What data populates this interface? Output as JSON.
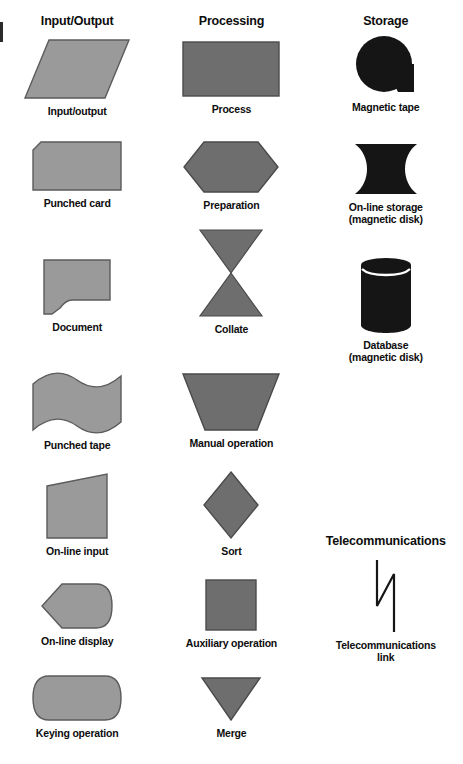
{
  "page": {
    "background_color": "#ffffff",
    "colors": {
      "io_fill": "#9a9a9a",
      "processing_fill": "#6e6e6e",
      "storage_fill": "#151515",
      "outline": "#4a4a4a",
      "text": "#0d0d0d"
    }
  },
  "columns": [
    {
      "key": "input_output",
      "header": "Input/Output",
      "fill": "#9a9a9a",
      "items": [
        {
          "label": "Input/output",
          "shape": "parallelogram"
        },
        {
          "label": "Punched card",
          "shape": "punched-card"
        },
        {
          "label": "Document",
          "shape": "document"
        },
        {
          "label": "Punched tape",
          "shape": "punched-tape"
        },
        {
          "label": "On-line input",
          "shape": "online-input"
        },
        {
          "label": "On-line display",
          "shape": "online-display"
        },
        {
          "label": "Keying operation",
          "shape": "keying-operation"
        }
      ]
    },
    {
      "key": "processing",
      "header": "Processing",
      "fill": "#6e6e6e",
      "items": [
        {
          "label": "Process",
          "shape": "rectangle"
        },
        {
          "label": "Preparation",
          "shape": "hexagon"
        },
        {
          "label": "Collate",
          "shape": "collate"
        },
        {
          "label": "Manual operation",
          "shape": "manual-operation"
        },
        {
          "label": "Sort",
          "shape": "diamond"
        },
        {
          "label": "Auxiliary operation",
          "shape": "square"
        },
        {
          "label": "Merge",
          "shape": "merge"
        }
      ]
    },
    {
      "key": "storage",
      "header": "Storage",
      "fill": "#151515",
      "items": [
        {
          "label": "Magnetic tape",
          "shape": "magnetic-tape"
        },
        {
          "label": "On-line storage\n(magnetic disk)",
          "shape": "online-storage"
        },
        {
          "label": "Database\n(magnetic disk)",
          "shape": "database-cylinder"
        }
      ],
      "sub_section": {
        "header": "Telecommunications",
        "items": [
          {
            "label": "Telecommunications\nlink",
            "shape": "telecom-link"
          }
        ]
      }
    }
  ]
}
